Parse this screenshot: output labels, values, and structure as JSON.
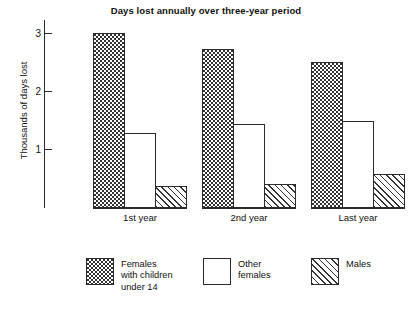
{
  "chart_data": {
    "type": "bar",
    "title": "Days lost annually over three-year period",
    "xlabel": "",
    "ylabel": "Thousands of days lost",
    "categories": [
      "1st year",
      "2nd year",
      "Last year"
    ],
    "series": [
      {
        "name": "Females with children under 14",
        "values": [
          3.07,
          2.79,
          2.57
        ],
        "fill": "dotted"
      },
      {
        "name": "Other females",
        "values": [
          1.31,
          1.47,
          1.53
        ],
        "fill": "blank"
      },
      {
        "name": "Males",
        "values": [
          0.38,
          0.42,
          0.59
        ],
        "fill": "hatched"
      }
    ],
    "ylim": [
      0,
      3.3
    ],
    "yticks": [
      1,
      2,
      3
    ],
    "ytick_labels": [
      "1",
      "2",
      "3"
    ],
    "grid": false,
    "legend_position": "bottom"
  },
  "axis": {
    "ticks": [
      {
        "label": "3",
        "value": 3
      },
      {
        "label": "2",
        "value": 2
      },
      {
        "label": "1",
        "value": 1
      }
    ]
  },
  "legend": {
    "items": [
      {
        "label": "Females\nwith children\nunder 14"
      },
      {
        "label": "Other\nfemales"
      },
      {
        "label": "Males"
      }
    ]
  },
  "colors": {
    "ink": "#2b2b2b",
    "background": "#ffffff",
    "pattern": "#333333"
  }
}
